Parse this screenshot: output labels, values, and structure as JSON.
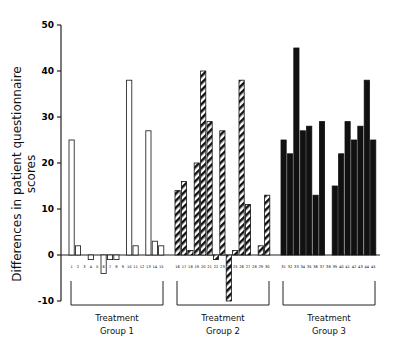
{
  "chart_data": {
    "type": "bar",
    "title": "",
    "xlabel": "",
    "ylabel": "Differences in patient questionnaire scores",
    "ylim": [
      -10,
      50
    ],
    "yticks": [
      50,
      40,
      30,
      20,
      10,
      0,
      -10
    ],
    "grid": false,
    "legend": "none",
    "groups": [
      {
        "name": "Treatment Group 1",
        "line1": "Treatment",
        "line2": "Group 1",
        "fill": "white",
        "patients": [
          1,
          2,
          3,
          4,
          5,
          6,
          7,
          8,
          9,
          10,
          11,
          12,
          13,
          14,
          15
        ],
        "values": [
          25,
          2,
          0,
          -1,
          0,
          -4,
          -1,
          -1,
          0,
          38,
          2,
          0,
          27,
          3,
          2
        ]
      },
      {
        "name": "Treatment Group 2",
        "line1": "Treatment",
        "line2": "Group 2",
        "fill": "hatched",
        "patients": [
          16,
          17,
          18,
          19,
          20,
          21,
          22,
          23,
          24,
          25,
          26,
          27,
          28,
          29,
          30
        ],
        "values": [
          14,
          16,
          1,
          20,
          40,
          29,
          -1,
          27,
          -10,
          1,
          38,
          11,
          0,
          2,
          13
        ]
      },
      {
        "name": "Treatment Group 3",
        "line1": "Treatment",
        "line2": "Group 3",
        "fill": "black",
        "patients": [
          31,
          32,
          33,
          34,
          35,
          36,
          37,
          38,
          39,
          40,
          41,
          42,
          43,
          44,
          45
        ],
        "values": [
          25,
          22,
          45,
          27,
          28,
          13,
          29,
          0,
          15,
          22,
          29,
          25,
          28,
          38,
          25
        ]
      }
    ]
  }
}
